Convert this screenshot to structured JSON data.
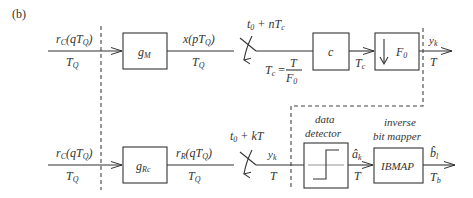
{
  "panel_label": "(b)",
  "top_row": {
    "input_signal": "r",
    "input_sub": "C",
    "input_arg": "(qT",
    "input_arg_sub": "Q",
    "input_close": ")",
    "input_rate": "T",
    "input_rate_sub": "Q",
    "block1_label": "g",
    "block1_sub": "M",
    "mid_signal": "x(pT",
    "mid_signal_sub": "Q",
    "mid_close": ")",
    "mid_rate": "T",
    "mid_rate_sub": "Q",
    "sampler_label": "t",
    "sampler_sub": "0",
    "sampler_rest": " + nT",
    "sampler_rest_sub": "c",
    "tc_eq_left": "T",
    "tc_eq_left_sub": "c",
    "tc_eq_sign": " = ",
    "tc_num": "T",
    "tc_den": "F",
    "tc_den_sub": "0",
    "block2_label": "c",
    "block2_out_rate": "T",
    "block2_out_rate_sub": "c",
    "block3_label": "F",
    "block3_sub": "0",
    "out_signal": "y",
    "out_signal_sub": "k",
    "out_rate": "T"
  },
  "bottom_row": {
    "input_signal": "r",
    "input_sub": "C",
    "input_arg": "(qT",
    "input_arg_sub": "Q",
    "input_close": ")",
    "input_rate": "T",
    "input_rate_sub": "Q",
    "block1_label": "g",
    "block1_sub": "Rc",
    "mid_signal": "r",
    "mid_signal_sub": "R",
    "mid_arg": "(qT",
    "mid_arg_sub": "Q",
    "mid_close": ")",
    "mid_rate": "T",
    "mid_rate_sub": "Q",
    "sampler_label": "t",
    "sampler_sub": "0",
    "sampler_rest": " + kT",
    "samp_signal": "y",
    "samp_signal_sub": "k",
    "samp_rate": "T",
    "detector_title_1": "data",
    "detector_title_2": "detector",
    "det_out": "â",
    "det_out_sub": "k",
    "det_out_rate": "T",
    "mapper_title_1": "inverse",
    "mapper_title_2": "bit mapper",
    "mapper_label": "IBMAP",
    "out_signal": "b̂",
    "out_signal_sub": "l",
    "out_rate": "T",
    "out_rate_sub": "b"
  }
}
